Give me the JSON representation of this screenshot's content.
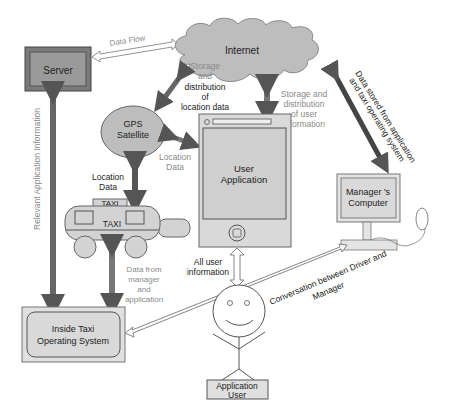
{
  "diagram": {
    "nodes": {
      "server": {
        "label": "Server"
      },
      "internet": {
        "label": "Internet"
      },
      "gps": {
        "label_line1": "GPS",
        "label_line2": "Satellite"
      },
      "user_app": {
        "label_line1": "User",
        "label_line2": "Application"
      },
      "taxi": {
        "roof_sign": "TAXI",
        "body_label": "TAXI"
      },
      "manager_computer": {
        "label_line1": "Manager 's",
        "label_line2": "Computer"
      },
      "inside_taxi_os": {
        "label_line1": "Inside Taxi",
        "label_line2": "Operating System"
      },
      "app_user": {
        "label_line1": "Application",
        "label_line2": "User"
      }
    },
    "edges": {
      "data_flow": {
        "label": "Data Flow"
      },
      "storage_location": {
        "lines": [
          "Storage",
          "and",
          "distribution",
          "of",
          "location data"
        ]
      },
      "storage_user": {
        "lines": [
          "Storage and",
          "distribution",
          "of user",
          "information"
        ]
      },
      "location_data_app": {
        "lines": [
          "Location",
          "Data"
        ]
      },
      "location_data_taxi": {
        "lines": [
          "Location",
          "Data"
        ]
      },
      "data_stored": {
        "lines": [
          "Data stored from application",
          "and taxi operating system"
        ]
      },
      "relevant_info": {
        "label": "Relevant Application Information"
      },
      "data_from_manager": {
        "lines": [
          "Data from",
          "manager",
          "and",
          "application"
        ]
      },
      "all_user_info": {
        "lines": [
          "All user",
          "information"
        ]
      },
      "conversation": {
        "lines": [
          "Conversation between Driver and",
          "Manager"
        ]
      }
    },
    "colors": {
      "node_fill": "#d3d3d3",
      "server_fill": "#9a9a9a",
      "dark_arrow": "#555555",
      "mid_arrow": "#707070",
      "outline": "#555555"
    }
  }
}
